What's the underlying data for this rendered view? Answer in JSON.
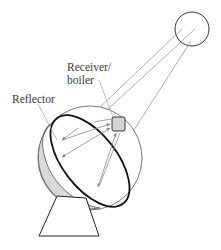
{
  "diagram": {
    "labels": {
      "receiver_line1": "Receiver/",
      "receiver_line2": "boiler",
      "reflector": "Reflector"
    },
    "components": [
      {
        "id": "sun",
        "shape": "circle"
      },
      {
        "id": "receiver",
        "shape": "rounded-square",
        "fill": "#d4d4d4"
      },
      {
        "id": "reflector-dish",
        "shape": "ellipse-rim-with-sphere"
      },
      {
        "id": "stand",
        "shape": "trapezoid"
      }
    ],
    "rays": {
      "incoming_count": 3,
      "reflected_count": 5,
      "color": "#8c8c8c"
    },
    "colors": {
      "outline": "#1a1a1a",
      "ray": "#8c8c8c",
      "shading": "#d9d9d9",
      "receiver_fill": "#d4d4d4",
      "leader": "#b0b0b0"
    }
  }
}
